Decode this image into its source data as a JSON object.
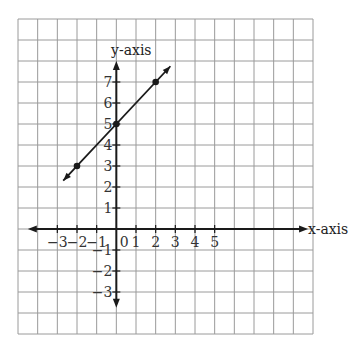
{
  "chart_data": {
    "type": "line",
    "title": "",
    "xlabel": "x-axis",
    "ylabel": "y-axis",
    "grid": true,
    "grid_range": {
      "x": [
        -5,
        10
      ],
      "y": [
        -5,
        10
      ]
    },
    "xlim": [
      -3,
      5
    ],
    "ylim": [
      -3,
      7
    ],
    "x_tick_labels": [
      "−3",
      "−2",
      "−1",
      "0",
      "1",
      "2",
      "3",
      "4",
      "5"
    ],
    "x_ticks": [
      -3,
      -2,
      -1,
      0,
      1,
      2,
      3,
      4,
      5
    ],
    "y_tick_labels": [
      "7",
      "6",
      "5",
      "4",
      "3",
      "2",
      "1",
      "−1",
      "−2",
      "−3"
    ],
    "y_ticks": [
      7,
      6,
      5,
      4,
      3,
      2,
      1,
      -1,
      -2,
      -3
    ],
    "series": [
      {
        "name": "line",
        "equation": "y = x + 5",
        "points": [
          {
            "x": -2,
            "y": 3
          },
          {
            "x": 0,
            "y": 5
          },
          {
            "x": 2,
            "y": 7
          }
        ],
        "extent": {
          "from": [
            -2.7,
            2.3
          ],
          "to": [
            2.75,
            7.75
          ]
        },
        "arrows": "both",
        "color": "#1a1a1a"
      }
    ],
    "axes": {
      "x_arrow_range": [
        -4.5,
        9.75
      ],
      "y_arrow_range": [
        -3.75,
        8.0
      ]
    },
    "colors": {
      "grid": "#9a9a9a",
      "axis": "#1a1a1a",
      "text": "#333333"
    }
  }
}
